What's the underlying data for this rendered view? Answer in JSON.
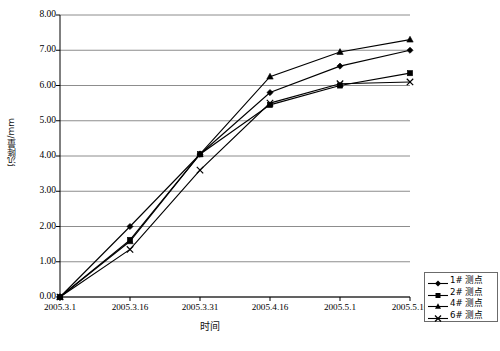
{
  "chart_data": {
    "type": "line",
    "title": "",
    "xlabel": "时间",
    "ylabel": "沉降量/mm",
    "categories": [
      "2005.3.1",
      "2005.3.16",
      "2005.3.31",
      "2005.4.16",
      "2005.5.1",
      "2005.5.16"
    ],
    "ylim": [
      0.0,
      8.0
    ],
    "ytick_step": 1.0,
    "yticks": [
      "0.00",
      "1.00",
      "2.00",
      "3.00",
      "4.00",
      "5.00",
      "6.00",
      "7.00",
      "8.00"
    ],
    "grid": "horizontal",
    "legend_position": "bottom-right-outside",
    "series": [
      {
        "name": "1# 测点",
        "marker": "diamond",
        "values": [
          0.0,
          2.0,
          4.05,
          5.8,
          6.55,
          7.0
        ]
      },
      {
        "name": "2# 测点",
        "marker": "square",
        "values": [
          0.0,
          1.62,
          4.05,
          5.45,
          6.0,
          6.35
        ]
      },
      {
        "name": "4# 测点",
        "marker": "triangle",
        "values": [
          0.0,
          1.58,
          4.05,
          6.25,
          6.95,
          7.3
        ]
      },
      {
        "name": "6# 测点",
        "marker": "cross",
        "values": [
          0.0,
          1.35,
          3.6,
          5.5,
          6.05,
          6.1
        ]
      }
    ]
  },
  "legend": {
    "items": [
      {
        "label": "1# 测点"
      },
      {
        "label": "2# 测点"
      },
      {
        "label": "4# 测点"
      },
      {
        "label": "6# 测点"
      }
    ]
  },
  "caption": {
    "text": ""
  },
  "colors": {
    "line": "#000000",
    "grid": "#808080",
    "axis": "#000000",
    "background": "#ffffff",
    "legend_border": "#6b6b6b"
  }
}
